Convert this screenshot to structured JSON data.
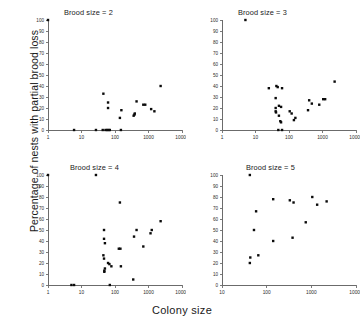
{
  "figure": {
    "xlabel": "Colony size",
    "ylabel": "Percentage of nests with partial brood loss"
  },
  "chart_data": [
    {
      "type": "scatter",
      "title": "Brood size = 2",
      "xlabel": "Colony size",
      "ylabel": "Percentage of nests with partial brood loss",
      "xscale": "log",
      "xlim": [
        1,
        10000
      ],
      "ylim": [
        0,
        100
      ],
      "xticks": [
        1,
        10,
        100,
        1000,
        10000
      ],
      "xticklabels": [
        "1",
        "10",
        "100",
        "1000",
        "10000"
      ],
      "yticks": [
        0,
        10,
        20,
        30,
        40,
        50,
        60,
        70,
        80,
        90,
        100
      ],
      "yticklabels": [
        "0",
        "10",
        "20",
        "30",
        "40",
        "50",
        "60",
        "70",
        "80",
        "90",
        "100"
      ],
      "grid": false,
      "legend": false,
      "marker": "square",
      "color": "#000000",
      "points": [
        {
          "x": 1,
          "y": 100
        },
        {
          "x": 6,
          "y": 0
        },
        {
          "x": 27,
          "y": 0
        },
        {
          "x": 43,
          "y": 0
        },
        {
          "x": 52,
          "y": 0
        },
        {
          "x": 58,
          "y": 0
        },
        {
          "x": 64,
          "y": 0
        },
        {
          "x": 70,
          "y": 0
        },
        {
          "x": 150,
          "y": 0
        },
        {
          "x": 45,
          "y": 33
        },
        {
          "x": 62,
          "y": 25
        },
        {
          "x": 62,
          "y": 20
        },
        {
          "x": 140,
          "y": 11
        },
        {
          "x": 155,
          "y": 18
        },
        {
          "x": 360,
          "y": 13
        },
        {
          "x": 380,
          "y": 14
        },
        {
          "x": 390,
          "y": 15
        },
        {
          "x": 440,
          "y": 26
        },
        {
          "x": 700,
          "y": 23
        },
        {
          "x": 800,
          "y": 23
        },
        {
          "x": 1200,
          "y": 19
        },
        {
          "x": 1500,
          "y": 17
        },
        {
          "x": 2300,
          "y": 40
        }
      ]
    },
    {
      "type": "scatter",
      "title": "Brood size = 3",
      "xlabel": "Colony size",
      "ylabel": "Percentage of nests with partial brood loss",
      "xscale": "log",
      "xlim": [
        1,
        10000
      ],
      "ylim": [
        0,
        100
      ],
      "xticks": [
        1,
        10,
        100,
        1000,
        10000
      ],
      "xticklabels": [
        "1",
        "10",
        "100",
        "1000",
        "10000"
      ],
      "yticks": [
        0,
        10,
        20,
        30,
        40,
        50,
        60,
        70,
        80,
        90,
        100
      ],
      "yticklabels": [
        "0",
        "10",
        "20",
        "30",
        "40",
        "50",
        "60",
        "70",
        "80",
        "90",
        "100"
      ],
      "grid": false,
      "legend": false,
      "marker": "square",
      "color": "#000000",
      "points": [
        {
          "x": 5,
          "y": 100
        },
        {
          "x": 25,
          "y": 38
        },
        {
          "x": 42,
          "y": 40
        },
        {
          "x": 46,
          "y": 39
        },
        {
          "x": 62,
          "y": 38
        },
        {
          "x": 40,
          "y": 29
        },
        {
          "x": 40,
          "y": 20
        },
        {
          "x": 40,
          "y": 17
        },
        {
          "x": 41,
          "y": 16
        },
        {
          "x": 50,
          "y": 22
        },
        {
          "x": 58,
          "y": 21
        },
        {
          "x": 50,
          "y": 13
        },
        {
          "x": 55,
          "y": 8
        },
        {
          "x": 58,
          "y": 7
        },
        {
          "x": 48,
          "y": 0
        },
        {
          "x": 62,
          "y": 0
        },
        {
          "x": 105,
          "y": 17
        },
        {
          "x": 120,
          "y": 15
        },
        {
          "x": 140,
          "y": 9
        },
        {
          "x": 155,
          "y": 11
        },
        {
          "x": 370,
          "y": 18
        },
        {
          "x": 400,
          "y": 27
        },
        {
          "x": 480,
          "y": 24
        },
        {
          "x": 800,
          "y": 23
        },
        {
          "x": 1050,
          "y": 28
        },
        {
          "x": 1200,
          "y": 28
        },
        {
          "x": 2300,
          "y": 44
        }
      ]
    },
    {
      "type": "scatter",
      "title": "Brood size = 4",
      "xlabel": "Colony size",
      "ylabel": "Percentage of nests with partial brood loss",
      "xscale": "log",
      "xlim": [
        1,
        10000
      ],
      "ylim": [
        0,
        100
      ],
      "xticks": [
        1,
        10,
        100,
        1000,
        10000
      ],
      "xticklabels": [
        "1",
        "10",
        "100",
        "1000",
        "10000"
      ],
      "yticks": [
        0,
        10,
        20,
        30,
        40,
        50,
        60,
        70,
        80,
        90,
        100
      ],
      "yticklabels": [
        "0",
        "10",
        "20",
        "30",
        "40",
        "50",
        "60",
        "70",
        "80",
        "90",
        "100"
      ],
      "grid": false,
      "legend": false,
      "marker": "square",
      "color": "#000000",
      "points": [
        {
          "x": 1,
          "y": 100
        },
        {
          "x": 27,
          "y": 100
        },
        {
          "x": 5,
          "y": 0
        },
        {
          "x": 6,
          "y": 0
        },
        {
          "x": 140,
          "y": 75
        },
        {
          "x": 47,
          "y": 50
        },
        {
          "x": 47,
          "y": 42
        },
        {
          "x": 50,
          "y": 38
        },
        {
          "x": 45,
          "y": 27
        },
        {
          "x": 47,
          "y": 24
        },
        {
          "x": 48,
          "y": 13
        },
        {
          "x": 48,
          "y": 12
        },
        {
          "x": 50,
          "y": 15
        },
        {
          "x": 62,
          "y": 20
        },
        {
          "x": 68,
          "y": 19
        },
        {
          "x": 70,
          "y": 0
        },
        {
          "x": 78,
          "y": 17
        },
        {
          "x": 130,
          "y": 33
        },
        {
          "x": 145,
          "y": 33
        },
        {
          "x": 150,
          "y": 17
        },
        {
          "x": 350,
          "y": 5
        },
        {
          "x": 370,
          "y": 44
        },
        {
          "x": 440,
          "y": 50
        },
        {
          "x": 700,
          "y": 35
        },
        {
          "x": 1150,
          "y": 47
        },
        {
          "x": 1250,
          "y": 50
        },
        {
          "x": 2300,
          "y": 58
        }
      ]
    },
    {
      "type": "scatter",
      "title": "Brood size = 5",
      "xlabel": "Colony size",
      "ylabel": "Percentage of nests with partial brood loss",
      "xscale": "log",
      "xlim": [
        10,
        10000
      ],
      "ylim": [
        0,
        100
      ],
      "xticks": [
        10,
        100,
        1000,
        10000
      ],
      "xticklabels": [
        "10",
        "100",
        "1000",
        "10000"
      ],
      "yticks": [
        0,
        10,
        20,
        30,
        40,
        50,
        60,
        70,
        80,
        90,
        100
      ],
      "yticklabels": [
        "0",
        "10",
        "20",
        "30",
        "40",
        "50",
        "60",
        "70",
        "80",
        "90",
        "100"
      ],
      "grid": false,
      "legend": false,
      "marker": "square",
      "color": "#000000",
      "points": [
        {
          "x": 42,
          "y": 100
        },
        {
          "x": 58,
          "y": 67
        },
        {
          "x": 52,
          "y": 50
        },
        {
          "x": 43,
          "y": 25
        },
        {
          "x": 42,
          "y": 20
        },
        {
          "x": 65,
          "y": 27
        },
        {
          "x": 140,
          "y": 78
        },
        {
          "x": 140,
          "y": 40
        },
        {
          "x": 330,
          "y": 77
        },
        {
          "x": 400,
          "y": 75
        },
        {
          "x": 380,
          "y": 43
        },
        {
          "x": 750,
          "y": 57
        },
        {
          "x": 1050,
          "y": 80
        },
        {
          "x": 1350,
          "y": 73
        },
        {
          "x": 2200,
          "y": 76
        }
      ]
    }
  ]
}
